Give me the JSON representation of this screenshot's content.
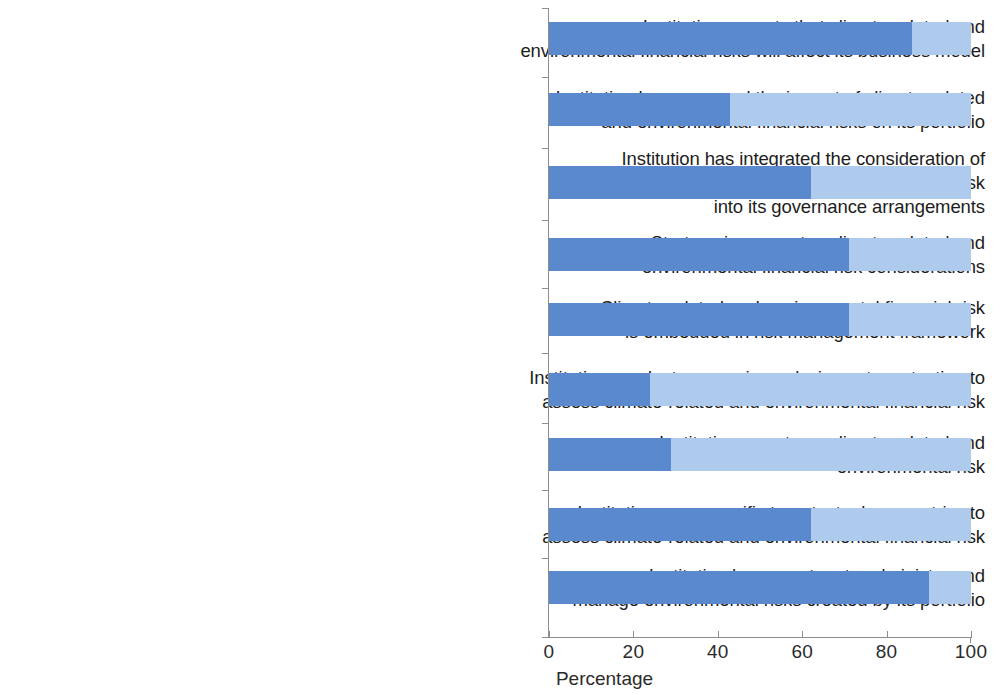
{
  "chart_data": {
    "type": "bar",
    "orientation": "horizontal",
    "stacked": true,
    "title": "",
    "subtitle": "",
    "xlabel": "Percentage",
    "ylabel": "",
    "xlim": [
      0,
      100
    ],
    "xticks": [
      0,
      20,
      40,
      60,
      80,
      100
    ],
    "xtick_labels": [
      "0",
      "20",
      "40",
      "60",
      "80",
      "100"
    ],
    "grid": false,
    "legend": "none",
    "colors": {
      "dark_blue": "#5a8acd",
      "light_blue": "#aecbee",
      "axis": "#8d8d8d",
      "text": "#1d1d1d",
      "background": "#ffffff"
    },
    "categories": [
      "Institution expects that climate-related and environmental financial risks will affect its business model",
      "Institution has assessed the impact of climate-related and environmental financial risks on its portfolio",
      "Institution has integrated the consideration of climate-related and environmental financial risk into its governance arrangements",
      "Strategy incorporates climate-related and environmental financial risk considerations",
      "Climate-related and environmental financial risk is embedded in risk management framework",
      "Institution conducts scenario analysis or stress testing to assess climate-related and environmental financial risk",
      "Institution reports on climate-related and environmental risk",
      "Institution uses specific targets, tools, or metrics to assess climate-related and environmental financial risk",
      "Institution has a system to administer and manage environmental risks created by its portfolio"
    ],
    "category_lines": [
      [
        "Institution expects that climate-related and",
        "environmental financial risks will affect its business model"
      ],
      [
        "Institution has assessed the impact of climate-related",
        "and environmental financial risks on its portfolio"
      ],
      [
        "Institution has integrated the consideration of",
        "climate-related and environmental financial risk",
        "into its governance arrangements"
      ],
      [
        "Strategy incorporates climate-related and",
        "environmental financial risk considerations"
      ],
      [
        "Climate-related and environmental financial risk",
        "is embedded in risk management framework"
      ],
      [
        "Institution conducts scenario analysis or stress testing to",
        "assess climate-related and environmental financial risk"
      ],
      [
        "Institution reports on climate-related and",
        "environmental risk"
      ],
      [
        "Institution uses specific targets, tools, or metrics to",
        "assess climate-related and environmental financial risk"
      ],
      [
        "Institution has a system to administer and",
        "manage environmental risks created by its portfolio"
      ]
    ],
    "series": [
      {
        "name": "dark",
        "color": "#5a8acd",
        "values": [
          86,
          43,
          62,
          71,
          71,
          24,
          29,
          62,
          90
        ]
      },
      {
        "name": "light",
        "color": "#aecbee",
        "values": [
          14,
          57,
          38,
          29,
          29,
          76,
          71,
          38,
          10
        ]
      }
    ]
  }
}
